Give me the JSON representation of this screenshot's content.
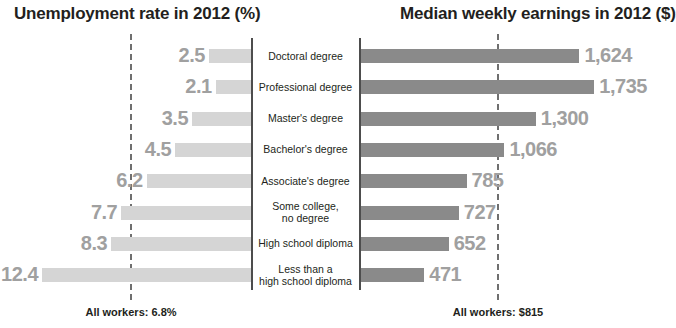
{
  "left_chart": {
    "title": "Unemployment rate in 2012 (%)",
    "reference_note": "All workers: 6.8%",
    "reference_value": 6.8
  },
  "right_chart": {
    "title": "Median weekly earnings in 2012 ($)",
    "reference_note": "All workers: $815",
    "reference_value": 815
  },
  "rows": [
    {
      "category": "Doctoral degree",
      "unemployment": "2.5",
      "earnings": "1,624"
    },
    {
      "category": "Professional degree",
      "unemployment": "2.1",
      "earnings": "1,735"
    },
    {
      "category": "Master's degree",
      "unemployment": "3.5",
      "earnings": "1,300"
    },
    {
      "category": "Bachelor's degree",
      "unemployment": "4.5",
      "earnings": "1,066"
    },
    {
      "category": "Associate's degree",
      "unemployment": "6.2",
      "earnings": "785"
    },
    {
      "category": "Some college,\nno degree",
      "unemployment": "7.7",
      "earnings": "727"
    },
    {
      "category": "High school diploma",
      "unemployment": "8.3",
      "earnings": "652"
    },
    {
      "category": "Less than a\nhigh school diploma",
      "unemployment": "12.4",
      "earnings": "471"
    }
  ],
  "colors": {
    "unemployment_bar": "#d5d5d5",
    "earnings_bar": "#8a8a8a",
    "value_label": "#a0a0a0",
    "axis": "#4d4d4d",
    "reference_line": "#6f6f6f",
    "text": "#231f20",
    "background": "#ffffff"
  },
  "chart_data": {
    "type": "bar",
    "layout": "paired horizontal bars, diverging from a central category column",
    "categories": [
      "Doctoral degree",
      "Professional degree",
      "Master's degree",
      "Bachelor's degree",
      "Associate's degree",
      "Some college, no degree",
      "High school diploma",
      "Less than a high school diploma"
    ],
    "series": [
      {
        "name": "Unemployment rate in 2012 (%)",
        "unit": "percent",
        "direction": "right-to-left",
        "values": [
          2.5,
          2.1,
          3.5,
          4.5,
          6.2,
          7.7,
          8.3,
          12.4
        ],
        "xlim": [
          0,
          13
        ],
        "reference_line": {
          "label": "All workers: 6.8%",
          "value": 6.8
        }
      },
      {
        "name": "Median weekly earnings in 2012 ($)",
        "unit": "dollars",
        "direction": "left-to-right",
        "values": [
          1624,
          1735,
          1300,
          1066,
          785,
          727,
          652,
          471
        ],
        "xlim": [
          0,
          1800
        ],
        "reference_line": {
          "label": "All workers: $815",
          "value": 815
        }
      }
    ],
    "grid": false,
    "legend": "none",
    "data_labels": true
  }
}
